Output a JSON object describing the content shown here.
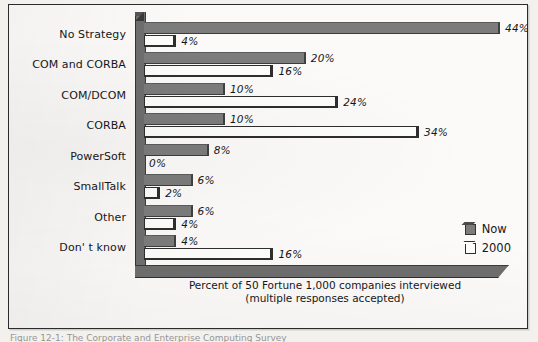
{
  "figure": {
    "xaxis_caption_line1": "Percent of 50 Fortune 1,000 companies interviewed",
    "xaxis_caption_line2": "(multiple responses accepted)",
    "caption_partial": "Figure 12-1: The Corporate and Enterprise Computing Survey"
  },
  "legend": {
    "now_label": "Now",
    "then_label": "2000",
    "now_color": "#7c7c7c",
    "then_color": "#fdfdfb"
  },
  "chart_data": {
    "type": "bar",
    "orientation": "horizontal",
    "title": "",
    "subtitle": "",
    "xlabel": "Percent of 50 Fortune 1,000 companies interviewed (multiple responses accepted)",
    "ylabel": "",
    "xlim": [
      0,
      44
    ],
    "grid": false,
    "legend_position": "bottom-right",
    "categories": [
      "No Strategy",
      "COM and CORBA",
      "COM/DCOM",
      "CORBA",
      "PowerSoft",
      "SmallTalk",
      "Other",
      "Don' t know"
    ],
    "series": [
      {
        "name": "Now",
        "color": "#7c7c7c",
        "values": [
          44,
          20,
          10,
          10,
          8,
          6,
          6,
          4
        ],
        "labels": [
          "44%",
          "20%",
          "10%",
          "10%",
          "8%",
          "6%",
          "6%",
          "4%"
        ]
      },
      {
        "name": "2000",
        "color": "#fdfdfb",
        "values": [
          4,
          16,
          24,
          34,
          0,
          2,
          4,
          16
        ],
        "labels": [
          "4%",
          "16%",
          "24%",
          "34%",
          "0%",
          "2%",
          "4%",
          "16%"
        ]
      }
    ]
  }
}
